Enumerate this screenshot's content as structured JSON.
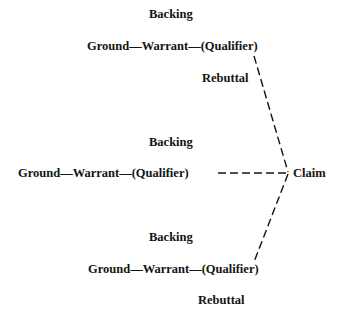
{
  "diagram": {
    "groups": [
      {
        "backing": "Backing",
        "chain": "Ground—Warrant—(Qualifier)",
        "rebuttal": "Rebuttal"
      },
      {
        "backing": "Backing",
        "chain": "Ground—Warrant—(Qualifier)"
      },
      {
        "backing": "Backing",
        "chain": "Ground—Warrant—(Qualifier)",
        "rebuttal": "Rebuttal"
      }
    ],
    "claim": "Claim",
    "line_color": "#141414",
    "line_style": "dashed"
  }
}
